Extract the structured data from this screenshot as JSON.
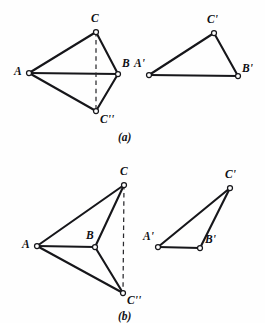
{
  "figure": {
    "kind": "geometry-diagram",
    "width": 265,
    "height": 323,
    "background_color": "#fefefe",
    "ink_color": "#16161a",
    "panels": [
      {
        "id": "panel-a",
        "caption": "(a)",
        "caption_pos": {
          "x": 118,
          "y": 132
        },
        "left_shape": {
          "name": "kite-ACBC2",
          "points": {
            "A": {
              "x": 29,
              "y": 73,
              "label": "A",
              "lx": 14,
              "ly": 66
            },
            "C": {
              "x": 96,
              "y": 32,
              "label": "C",
              "lx": 91,
              "ly": 13
            },
            "B": {
              "x": 118,
              "y": 74,
              "label": "B",
              "lx": 122,
              "ly": 58
            },
            "C2": {
              "x": 96,
              "y": 111,
              "label": "C''",
              "lx": 100,
              "ly": 114
            }
          },
          "solid_edges": [
            [
              "A",
              "C"
            ],
            [
              "C",
              "B"
            ],
            [
              "B",
              "C2"
            ],
            [
              "C2",
              "A"
            ],
            [
              "A",
              "B"
            ]
          ],
          "dashed_edges": [
            [
              "C",
              "C2"
            ]
          ]
        },
        "right_shape": {
          "name": "triangle-A1B1C1",
          "points": {
            "A1": {
              "x": 149,
              "y": 75,
              "label": "A'",
              "lx": 134,
              "ly": 58
            },
            "C1": {
              "x": 214,
              "y": 33,
              "label": "C'",
              "lx": 207,
              "ly": 14
            },
            "B1": {
              "x": 238,
              "y": 76,
              "label": "B'",
              "lx": 242,
              "ly": 63
            }
          },
          "solid_edges": [
            [
              "A1",
              "C1"
            ],
            [
              "C1",
              "B1"
            ],
            [
              "B1",
              "A1"
            ]
          ],
          "dashed_edges": []
        }
      },
      {
        "id": "panel-b",
        "caption": "(b)",
        "caption_pos": {
          "x": 118,
          "y": 311
        },
        "left_shape": {
          "name": "dart-ACBC2",
          "points": {
            "A": {
              "x": 37,
              "y": 246,
              "label": "A",
              "lx": 22,
              "ly": 239
            },
            "C": {
              "x": 124,
              "y": 185,
              "label": "C",
              "lx": 120,
              "ly": 166
            },
            "B": {
              "x": 95,
              "y": 247,
              "label": "B",
              "lx": 86,
              "ly": 230
            },
            "C2": {
              "x": 123,
              "y": 293,
              "label": "C''",
              "lx": 127,
              "ly": 295
            }
          },
          "solid_edges": [
            [
              "A",
              "C"
            ],
            [
              "C",
              "B"
            ],
            [
              "B",
              "C2"
            ],
            [
              "C2",
              "A"
            ],
            [
              "A",
              "B"
            ]
          ],
          "dashed_edges": [
            [
              "C",
              "C2"
            ]
          ]
        },
        "right_shape": {
          "name": "triangle-A1B1C1",
          "points": {
            "A1": {
              "x": 158,
              "y": 247,
              "label": "A'",
              "lx": 143,
              "ly": 231
            },
            "C1": {
              "x": 230,
              "y": 188,
              "label": "C'",
              "lx": 225,
              "ly": 169
            },
            "B1": {
              "x": 200,
              "y": 248,
              "label": "B'",
              "lx": 205,
              "ly": 234
            }
          },
          "solid_edges": [
            [
              "A1",
              "C1"
            ],
            [
              "C1",
              "B1"
            ],
            [
              "B1",
              "A1"
            ]
          ],
          "dashed_edges": []
        }
      }
    ]
  }
}
